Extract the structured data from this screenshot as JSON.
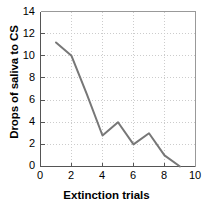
{
  "chart_data": {
    "type": "line",
    "title": "",
    "xlabel": "Extinction trials",
    "ylabel": "Drops of saliva to CS",
    "xlim": [
      0,
      10
    ],
    "ylim": [
      0,
      14
    ],
    "xticks": [
      0,
      2,
      4,
      6,
      8,
      10
    ],
    "yticks": [
      0,
      2,
      4,
      6,
      8,
      10,
      12,
      14
    ],
    "xtick_labels": [
      "0",
      "2",
      "4",
      "6",
      "8",
      "10"
    ],
    "ytick_labels": [
      "0",
      "2",
      "4",
      "6",
      "8",
      "10",
      "12",
      "14"
    ],
    "grid": true,
    "grid_style": "dotted",
    "grid_color": "#cccccc",
    "legend": null,
    "series": [
      {
        "name": "Drops of saliva",
        "color": "#777777",
        "line_width": 2,
        "markers": false,
        "x": [
          1,
          2,
          3,
          4,
          5,
          6,
          7,
          8,
          9
        ],
        "values": [
          11.2,
          10.0,
          6.5,
          2.8,
          4.0,
          2.0,
          3.0,
          1.0,
          0.0
        ]
      }
    ]
  },
  "axes": {
    "ylabel_text": "Drops of saliva to CS",
    "xlabel_text": "Extinction trials"
  },
  "colors": {
    "line": "#777777",
    "grid": "#cccccc",
    "axis": "#555555",
    "text": "#000000",
    "background": "#ffffff"
  }
}
